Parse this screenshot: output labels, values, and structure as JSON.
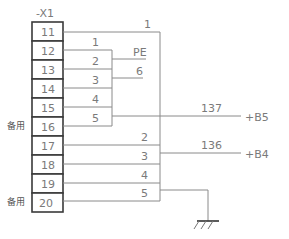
{
  "diagram": {
    "type": "terminal-block-wiring",
    "block_label": "-X1",
    "terminals": [
      {
        "id": "11",
        "y": 22
      },
      {
        "id": "12",
        "y": 41
      },
      {
        "id": "13",
        "y": 60
      },
      {
        "id": "14",
        "y": 79
      },
      {
        "id": "15",
        "y": 98
      },
      {
        "id": "16",
        "y": 117
      },
      {
        "id": "17",
        "y": 136
      },
      {
        "id": "18",
        "y": 155
      },
      {
        "id": "19",
        "y": 174
      },
      {
        "id": "20",
        "y": 193
      }
    ],
    "spare_labels": [
      {
        "text": "备用",
        "terminal": "16"
      },
      {
        "text": "备用",
        "terminal": "20"
      }
    ],
    "upper_group_wire_numbers": [
      "1",
      "2",
      "3",
      "4",
      "5"
    ],
    "upper_outer_wire_number": "1",
    "branch_labels": {
      "pe": "PE",
      "six": "6"
    },
    "lower_group_wire_numbers": [
      "2",
      "3",
      "4",
      "5"
    ],
    "outputs": [
      {
        "cable": "137",
        "target": "+B5"
      },
      {
        "cable": "136",
        "target": "+B4"
      }
    ],
    "ground_symbol": "ground-icon"
  }
}
